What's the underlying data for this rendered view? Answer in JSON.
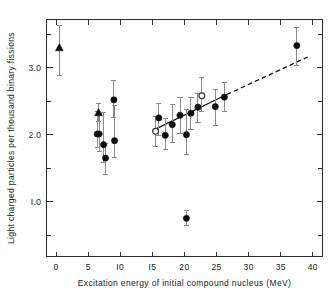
{
  "chart_data": {
    "type": "scatter",
    "title": "",
    "xlabel": "Excitation energy of initial compound nucleus (MeV)",
    "ylabel": "Light charged particles per thousand binary fissions",
    "xlim": [
      -1.5,
      41.5
    ],
    "ylim": [
      0.18,
      3.72
    ],
    "xticks": [
      0,
      5,
      10,
      15,
      20,
      25,
      30,
      35,
      40
    ],
    "xticklabels": [
      "0",
      "5",
      "I0",
      "I5",
      "20",
      "25",
      "30",
      "35",
      "40"
    ],
    "yticks": [
      0.5,
      1.0,
      1.5,
      2.0,
      2.5,
      3.0,
      3.5
    ],
    "ylabeled_ticks": [
      1.0,
      2.0,
      3.0
    ],
    "yticklabels": [
      "I.0",
      "2.0",
      "3.0"
    ],
    "grid": false,
    "legend": null,
    "frame": "box",
    "minor_ticks_y_interval": 0.5,
    "series": [
      {
        "name": "filled-triangle",
        "marker": "triangle",
        "fill": "solid",
        "color": "#0d0d0d",
        "points": [
          {
            "x": 0.5,
            "y": 3.3,
            "yerr_low": 0.42,
            "yerr_high": 0.33
          },
          {
            "x": 6.6,
            "y": 2.33,
            "yerr_low": 0.14,
            "yerr_high": 0.13
          }
        ]
      },
      {
        "name": "filled-circle",
        "marker": "circle",
        "fill": "solid",
        "color": "#0d0d0d",
        "points": [
          {
            "x": 6.4,
            "y": 2.01,
            "yerr_low": 0.2,
            "yerr_high": 0.33
          },
          {
            "x": 6.7,
            "y": 2.01,
            "yerr_low": 0.26,
            "yerr_high": 0.3
          },
          {
            "x": 7.4,
            "y": 1.85,
            "yerr_low": 0.26,
            "yerr_high": 0.48
          },
          {
            "x": 7.7,
            "y": 1.65,
            "yerr_low": 0.25,
            "yerr_high": 0.22
          },
          {
            "x": 9.0,
            "y": 2.52,
            "yerr_low": 0.26,
            "yerr_high": 0.29
          },
          {
            "x": 9.1,
            "y": 1.91,
            "yerr_low": 0.25,
            "yerr_high": 0.52
          },
          {
            "x": 16.0,
            "y": 2.25,
            "yerr_low": 0.26,
            "yerr_high": 0.22
          },
          {
            "x": 17.0,
            "y": 1.99,
            "yerr_low": 0.21,
            "yerr_high": 0.25
          },
          {
            "x": 18.1,
            "y": 2.15,
            "yerr_low": 0.26,
            "yerr_high": 0.3
          },
          {
            "x": 19.3,
            "y": 2.29,
            "yerr_low": 0.27,
            "yerr_high": 0.26
          },
          {
            "x": 20.3,
            "y": 2.0,
            "yerr_low": 0.3,
            "yerr_high": 0.37
          },
          {
            "x": 20.3,
            "y": 0.75,
            "yerr_low": 0.1,
            "yerr_high": 0.11
          },
          {
            "x": 21.0,
            "y": 2.32,
            "yerr_low": 0.24,
            "yerr_high": 0.23
          },
          {
            "x": 22.1,
            "y": 2.41,
            "yerr_low": 0.23,
            "yerr_high": 0.21
          },
          {
            "x": 24.8,
            "y": 2.42,
            "yerr_low": 0.28,
            "yerr_high": 0.25
          },
          {
            "x": 26.2,
            "y": 2.56,
            "yerr_low": 0.22,
            "yerr_high": 0.22
          },
          {
            "x": 37.5,
            "y": 3.33,
            "yerr_low": 0.29,
            "yerr_high": 0.27
          }
        ]
      },
      {
        "name": "open-circle",
        "marker": "circle",
        "fill": "open",
        "color": "#2b2b2b",
        "points": [
          {
            "x": 15.5,
            "y": 2.05,
            "yerr_low": 0.22,
            "yerr_high": 0.22
          },
          {
            "x": 22.7,
            "y": 2.58,
            "yerr_low": 0.23,
            "yerr_high": 0.27
          }
        ]
      }
    ],
    "fit_line": {
      "style": "solid-then-dashed",
      "solid_segment": {
        "x0": 15.0,
        "y0": 2.06,
        "x1": 26.6,
        "y1": 2.6
      },
      "dashed_segment": {
        "x0": 26.6,
        "y0": 2.6,
        "x1": 39.2,
        "y1": 3.16
      },
      "slope": 0.0455,
      "intercept": 1.381
    }
  }
}
